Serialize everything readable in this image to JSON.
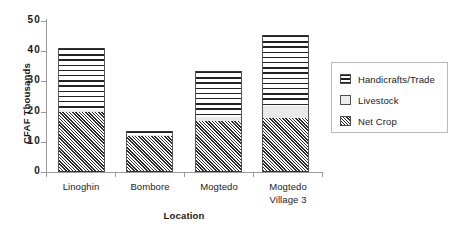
{
  "chart_data": {
    "type": "bar",
    "stacked": true,
    "title": "",
    "xlabel": "Location",
    "ylabel": "CFAF Thousands",
    "categories": [
      "Linoghin",
      "Bombore",
      "Mogtedo",
      "Mogtedo Village 3"
    ],
    "category_lines": [
      [
        "Linoghin"
      ],
      [
        "Bombore"
      ],
      [
        "Mogtedo"
      ],
      [
        "Mogtedo",
        "Village 3"
      ]
    ],
    "series": [
      {
        "name": "Net Crop",
        "values": [
          20,
          11.8,
          17,
          18
        ],
        "pattern": "diagonal-hatch"
      },
      {
        "name": "Livestock",
        "values": [
          0.6,
          0.5,
          1.2,
          4
        ],
        "pattern": "solid-light"
      },
      {
        "name": "Handicrafts/Trade",
        "values": [
          20.4,
          1.2,
          15.2,
          23.4
        ],
        "pattern": "horizontal-lines"
      }
    ],
    "totals": [
      41,
      13.5,
      33.4,
      45.4
    ],
    "ylim": [
      0,
      50
    ],
    "yticks": [
      0,
      10,
      20,
      30,
      40,
      50
    ],
    "ytick_labels": [
      "0",
      "10",
      "20",
      "30",
      "40",
      "50"
    ],
    "grid": false,
    "legend_position": "right"
  },
  "legend": {
    "items": [
      {
        "label": "Handicrafts/Trade",
        "swatch": "horizontal-lines-swatch"
      },
      {
        "label": "Livestock",
        "swatch": "light-fill-swatch"
      },
      {
        "label": "Net Crop",
        "swatch": "diagonal-hatch-swatch"
      }
    ]
  },
  "axes": {
    "y_title": "CFAF Thousands",
    "x_title": "Location"
  }
}
